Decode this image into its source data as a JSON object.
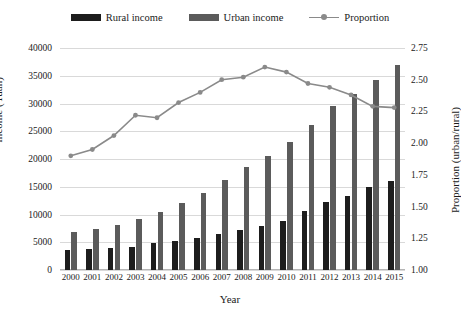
{
  "legend": {
    "items": [
      {
        "label": "Rural income",
        "type": "bar",
        "color": "#1d1d1d",
        "key": "rural-income-key"
      },
      {
        "label": "Urban income",
        "type": "bar",
        "color": "#5b5b5b",
        "key": "urban-income-key"
      },
      {
        "label": "Proportion",
        "type": "line",
        "color": "#8a8a8a",
        "key": "proportion-key"
      }
    ]
  },
  "axes": {
    "left": {
      "title": "Income (Yuan)",
      "ticks": [
        "40000",
        "35000",
        "30000",
        "25000",
        "20000",
        "15000",
        "10000",
        "5000",
        "0"
      ],
      "min": 0,
      "max": 40000,
      "step": 5000
    },
    "right": {
      "title": "Proportion (urban/rural)",
      "ticks": [
        "2.75",
        "2.50",
        "2.25",
        "2.00",
        "1.75",
        "1.50",
        "1.25",
        "1.00"
      ],
      "min": 1.0,
      "max": 2.75,
      "step": 0.25
    },
    "bottom": {
      "title": "Year"
    }
  },
  "chart_data": {
    "type": "bar",
    "title": "",
    "xlabel": "Year",
    "ylabel": "Income (Yuan)",
    "y2label": "Proportion (urban/rural)",
    "ylim": [
      0,
      40000
    ],
    "y2lim": [
      1.0,
      2.75
    ],
    "grid": true,
    "legend_position": "top-center",
    "categories": [
      "2000",
      "2001",
      "2002",
      "2003",
      "2004",
      "2005",
      "2006",
      "2007",
      "2008",
      "2009",
      "2010",
      "2011",
      "2012",
      "2013",
      "2014",
      "2015"
    ],
    "series": [
      {
        "name": "Rural income",
        "type": "bar",
        "axis": "left",
        "color": "#1d1d1d",
        "values": [
          3650,
          3850,
          4000,
          4150,
          4800,
          5250,
          5800,
          6400,
          7150,
          7900,
          8900,
          10600,
          12200,
          13400,
          14900,
          16100
        ]
      },
      {
        "name": "Urban income",
        "type": "bar",
        "axis": "left",
        "color": "#5b5b5b",
        "values": [
          6900,
          7450,
          8200,
          9200,
          10400,
          12100,
          13900,
          16300,
          18600,
          20500,
          23000,
          26100,
          29500,
          31800,
          34300,
          37000
        ]
      },
      {
        "name": "Proportion",
        "type": "line",
        "axis": "right",
        "color": "#8a8a8a",
        "values": [
          1.9,
          1.95,
          2.06,
          2.22,
          2.2,
          2.32,
          2.4,
          2.5,
          2.52,
          2.6,
          2.56,
          2.47,
          2.44,
          2.38,
          2.29,
          2.28
        ]
      }
    ]
  }
}
